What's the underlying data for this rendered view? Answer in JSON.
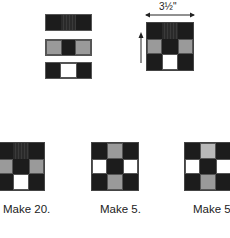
{
  "colors": {
    "dark": "#1c1c1c",
    "dark_striped": "#2a2a2a",
    "medium_gray": "#9a9a9a",
    "light_gray": "#b9b9b9",
    "white": "#ffffff"
  },
  "strips": [
    {
      "cells": [
        "dark",
        "dark_striped",
        "dark"
      ]
    },
    {
      "cells": [
        "medium_gray",
        "dark",
        "medium_gray"
      ]
    },
    {
      "cells": [
        "dark",
        "white",
        "dark"
      ]
    }
  ],
  "assembled_block": {
    "dimension_label": "3½\"",
    "grid": [
      [
        "dark",
        "dark_striped",
        "dark"
      ],
      [
        "medium_gray",
        "dark",
        "medium_gray"
      ],
      [
        "dark",
        "white",
        "dark"
      ]
    ]
  },
  "variants": [
    {
      "label": "Make 20.",
      "grid": [
        [
          "dark",
          "dark_striped",
          "dark"
        ],
        [
          "medium_gray",
          "dark",
          "medium_gray"
        ],
        [
          "dark",
          "white",
          "dark"
        ]
      ]
    },
    {
      "label": "Make 5.",
      "grid": [
        [
          "dark",
          "medium_gray",
          "dark"
        ],
        [
          "white",
          "dark",
          "white"
        ],
        [
          "dark",
          "medium_gray",
          "dark"
        ]
      ]
    },
    {
      "label": "Make 5.",
      "grid": [
        [
          "dark",
          "light_gray",
          "dark"
        ],
        [
          "white",
          "dark",
          "white"
        ],
        [
          "dark",
          "medium_gray",
          "dark"
        ]
      ]
    }
  ]
}
